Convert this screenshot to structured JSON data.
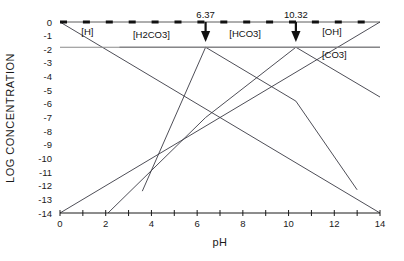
{
  "chart_data": {
    "type": "line",
    "title": "",
    "xlabel": "pH",
    "ylabel": "LOG CONCENTRATION",
    "xlim": [
      0,
      14
    ],
    "ylim": [
      -14,
      0
    ],
    "grid": false,
    "legend_position": "inline-annotations",
    "x_ticks": [
      0,
      1,
      2,
      3,
      4,
      5,
      6,
      7,
      8,
      9,
      10,
      11,
      12,
      13,
      14
    ],
    "x_tick_labels": [
      "0",
      "",
      "2",
      "",
      "4",
      "",
      "6",
      "",
      "8",
      "",
      "10",
      "",
      "12",
      "",
      "14"
    ],
    "y_ticks": [
      0,
      -1,
      -2,
      -3,
      -4,
      -5,
      -6,
      -7,
      -8,
      -9,
      -10,
      -11,
      -12,
      -13,
      -14
    ],
    "y_tick_labels": [
      "0",
      "-1",
      "-2",
      "-3",
      "-4",
      "-5",
      "-6",
      "-7",
      "-8",
      "-9",
      "-10",
      "-11",
      "-12",
      "-13",
      "-14"
    ],
    "reference_lines": [
      {
        "name": "total-carbonate",
        "orientation": "horizontal",
        "value": -1.85,
        "color": "#8a8a8a"
      },
      {
        "name": "top-dashed-axis",
        "orientation": "horizontal",
        "value": 0,
        "style": "dashed",
        "color": "#111111"
      }
    ],
    "markers": [
      {
        "label": "6.37",
        "x": 6.37,
        "type": "down-arrow"
      },
      {
        "label": "10.32",
        "x": 10.32,
        "type": "down-arrow"
      }
    ],
    "series": [
      {
        "name": "[H]",
        "label": "[H]",
        "label_x": 1.2,
        "label_y": -0.95,
        "points": [
          [
            0,
            0
          ],
          [
            14,
            -14
          ]
        ]
      },
      {
        "name": "[OH]",
        "label": "[OH]",
        "label_x": 11.9,
        "label_y": -0.95,
        "points": [
          [
            0,
            -14
          ],
          [
            14,
            0
          ]
        ]
      },
      {
        "name": "[H2CO3]",
        "label": "[H2CO3]",
        "label_x": 4.0,
        "label_y": -1.15,
        "points": [
          [
            2.6,
            -1.85
          ],
          [
            6.37,
            -1.85
          ],
          [
            10.32,
            -5.8
          ],
          [
            13.0,
            -12.3
          ]
        ]
      },
      {
        "name": "[HCO3]",
        "label": "[HCO3]",
        "label_x": 8.1,
        "label_y": -1.1,
        "points": [
          [
            3.6,
            -12.4
          ],
          [
            6.37,
            -1.85
          ],
          [
            10.32,
            -1.85
          ],
          [
            14.0,
            -5.5
          ]
        ]
      },
      {
        "name": "[CO3]",
        "label": "[CO3]",
        "label_x": 12.0,
        "label_y": -2.65,
        "points": [
          [
            2.1,
            -14.0
          ],
          [
            6.37,
            -7.0
          ],
          [
            10.32,
            -1.85
          ],
          [
            14.0,
            -1.85
          ]
        ]
      }
    ]
  },
  "axes": {
    "x_axis_name": "pH",
    "y_axis_name": "LOG CONCENTRATION"
  }
}
